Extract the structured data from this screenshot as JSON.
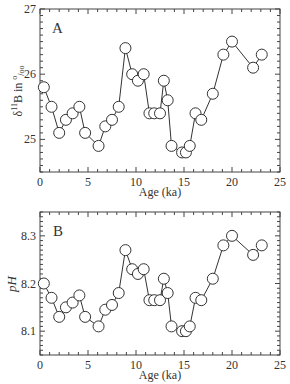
{
  "figure": {
    "panels": [
      "A",
      "B"
    ]
  },
  "chart_data": [
    {
      "type": "line",
      "panel_label": "A",
      "title": "",
      "xlabel": "Age (ka)",
      "ylabel": "δ11B in ‰",
      "ylabel_parts": {
        "delta": "δ",
        "sup": "11",
        "rest": "B in ",
        "unit_sup": "o",
        "unit_sub": "/oo"
      },
      "xlim": [
        0,
        25
      ],
      "ylim": [
        24.5,
        27
      ],
      "xticks": [
        0,
        5,
        10,
        15,
        20,
        25
      ],
      "yticks": [
        25,
        26,
        27
      ],
      "ytick_labels": [
        "25",
        "26",
        "27"
      ],
      "xtick_labels": [
        "0",
        "5",
        "10",
        "15",
        "20",
        "25"
      ],
      "marker": "open-circle",
      "grid": false,
      "x": [
        0.4,
        1.2,
        2.0,
        2.7,
        3.4,
        4.1,
        4.7,
        6.1,
        6.8,
        7.5,
        8.2,
        8.9,
        9.6,
        10.2,
        10.8,
        11.4,
        11.9,
        12.5,
        12.9,
        13.3,
        13.7,
        14.8,
        15.2,
        15.6,
        16.2,
        16.8,
        18.0,
        19.1,
        20.0,
        22.2,
        23.1
      ],
      "y": [
        25.8,
        25.5,
        25.1,
        25.3,
        25.4,
        25.5,
        25.1,
        24.9,
        25.2,
        25.3,
        25.5,
        26.4,
        26.0,
        25.9,
        26.0,
        25.4,
        25.4,
        25.4,
        25.9,
        25.6,
        24.9,
        24.8,
        24.8,
        24.9,
        25.4,
        25.3,
        25.7,
        26.3,
        26.5,
        26.1,
        26.3
      ]
    },
    {
      "type": "line",
      "panel_label": "B",
      "title": "",
      "xlabel": "Age (ka)",
      "ylabel": "pH",
      "xlim": [
        0,
        25
      ],
      "ylim": [
        8.05,
        8.35
      ],
      "xticks": [
        0,
        5,
        10,
        15,
        20,
        25
      ],
      "yticks": [
        8.1,
        8.2,
        8.3
      ],
      "ytick_labels": [
        "8.1",
        "8.2",
        "8.3"
      ],
      "xtick_labels": [
        "0",
        "5",
        "10",
        "15",
        "20",
        "25"
      ],
      "marker": "open-circle",
      "grid": false,
      "x": [
        0.4,
        1.2,
        2.0,
        2.7,
        3.4,
        4.1,
        4.7,
        6.1,
        6.8,
        7.5,
        8.2,
        8.9,
        9.6,
        10.2,
        10.8,
        11.4,
        11.9,
        12.5,
        12.9,
        13.3,
        13.7,
        14.8,
        15.2,
        15.6,
        16.2,
        16.8,
        18.0,
        19.1,
        20.0,
        22.2,
        23.1
      ],
      "y": [
        8.2,
        8.17,
        8.13,
        8.15,
        8.16,
        8.175,
        8.13,
        8.11,
        8.145,
        8.155,
        8.18,
        8.27,
        8.23,
        8.22,
        8.23,
        8.165,
        8.165,
        8.165,
        8.21,
        8.18,
        8.11,
        8.1,
        8.1,
        8.11,
        8.17,
        8.165,
        8.21,
        8.28,
        8.3,
        8.26,
        8.28
      ]
    }
  ]
}
